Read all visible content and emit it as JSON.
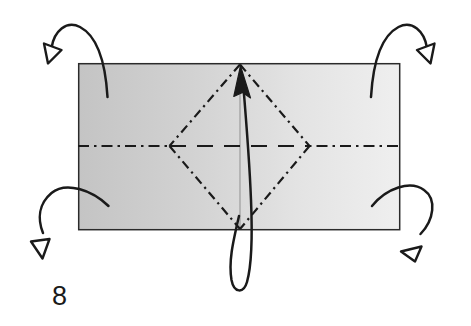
{
  "figure": {
    "step_number": "8",
    "background_color": "#ffffff",
    "ink_color": "#1a1a1a"
  },
  "paper_sheet": {
    "name": "rectangular paper sheet",
    "x": 78,
    "y": 63,
    "width": 322,
    "height": 167,
    "fill_left_color": "#c8c8c8",
    "fill_right_color": "#ececec",
    "stroke_color": "#2b2b2b",
    "stroke_width": 1.4
  },
  "center_fold_line": {
    "name": "vertical center crease",
    "x": 240,
    "y_top": 63,
    "y_bottom": 230,
    "color": "#9a9a9a",
    "style": "solid",
    "width": 1
  },
  "horizontal_axis_line": {
    "name": "horizontal center axis",
    "y": 146,
    "x_start": 78,
    "x_end": 400,
    "color": "#1a1a1a",
    "style_outside": "dash-dot",
    "style_inside": "dashed",
    "width": 2.1
  },
  "diamond": {
    "name": "diamond crease pattern",
    "top": {
      "x": 240,
      "y": 64
    },
    "right": {
      "x": 310,
      "y": 146
    },
    "bottom": {
      "x": 240,
      "y": 229
    },
    "left": {
      "x": 169,
      "y": 146
    },
    "color": "#1a1a1a",
    "style": "dash-dot",
    "width": 2.1
  },
  "loop_arrow": {
    "name": "fold-and-unfold loop arrow",
    "description": "elongated loop passing below the sheet, tip points up at top diamond vertex",
    "color": "#1a1a1a",
    "width": 2.4,
    "arrowhead": "solid",
    "tip": {
      "x": 240,
      "y": 70
    }
  },
  "corner_arrows": [
    {
      "name": "top-left fold arrow",
      "position": "top-left",
      "tail": {
        "x": 107,
        "y": 96
      },
      "tip": {
        "x": 50,
        "y": 60
      },
      "direction": "up-and-over to the left",
      "arrowhead": "hollow",
      "color": "#1a1a1a",
      "width": 2.4
    },
    {
      "name": "top-right fold arrow",
      "position": "top-right",
      "tail": {
        "x": 371,
        "y": 96
      },
      "tip": {
        "x": 437,
        "y": 60
      },
      "direction": "up-and-over to the right",
      "arrowhead": "hollow",
      "color": "#1a1a1a",
      "width": 2.4
    },
    {
      "name": "bottom-left fold arrow",
      "position": "bottom-left",
      "tail": {
        "x": 108,
        "y": 206
      },
      "tip": {
        "x": 42,
        "y": 253
      },
      "direction": "down-and-over to the left",
      "arrowhead": "hollow",
      "color": "#1a1a1a",
      "width": 2.4
    },
    {
      "name": "bottom-right fold arrow",
      "position": "bottom-right",
      "tail": {
        "x": 372,
        "y": 206
      },
      "tip": {
        "x": 410,
        "y": 252
      },
      "direction": "down-and-over to the right",
      "arrowhead": "hollow",
      "color": "#1a1a1a",
      "width": 2.4
    }
  ]
}
